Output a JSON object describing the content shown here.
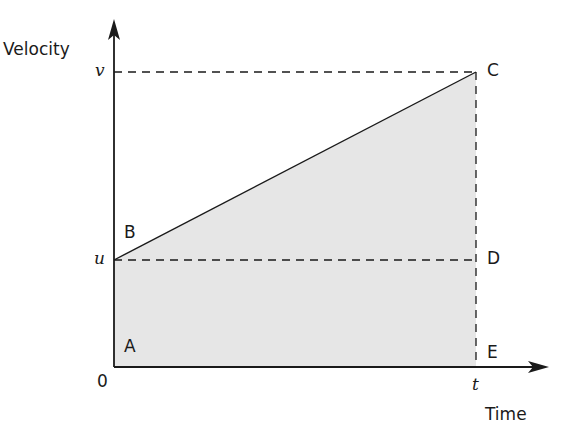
{
  "diagram": {
    "axes": {
      "y_label": "Velocity",
      "x_label": "Time",
      "origin_label": "0",
      "y_ticks": [
        {
          "label": "v",
          "meaning": "final velocity"
        },
        {
          "label": "u",
          "meaning": "initial velocity"
        }
      ],
      "x_ticks": [
        {
          "label": "t",
          "meaning": "time"
        }
      ]
    },
    "points": {
      "A": "A",
      "B": "B",
      "C": "C",
      "D": "D",
      "E": "E"
    },
    "shading_color": "#e6e6e6",
    "line_color": "#1a1a1a"
  }
}
